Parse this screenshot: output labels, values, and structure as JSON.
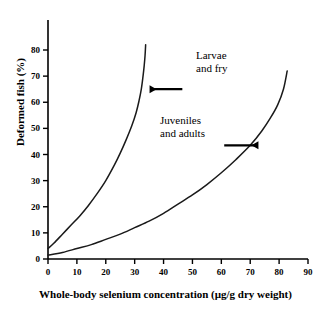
{
  "chart_data": {
    "type": "line",
    "title": "",
    "xlabel": "Whole-body selenium concentration (µg/g dry weight)",
    "ylabel": "Deformed fish (%)",
    "xlim": [
      0,
      90
    ],
    "ylim": [
      0,
      80
    ],
    "xticks": [
      0,
      10,
      20,
      30,
      40,
      50,
      60,
      70,
      80,
      90
    ],
    "yticks": [
      0,
      10,
      20,
      30,
      40,
      50,
      60,
      70,
      80
    ],
    "grid": false,
    "legend": "none",
    "line_color": "#1a1a1a",
    "axis_color": "#000000",
    "series": [
      {
        "name": "Larvae and fry",
        "x": [
          0,
          2,
          5,
          8,
          11,
          14,
          17,
          20,
          23,
          25,
          27,
          29,
          30.5,
          31.5,
          32.3,
          32.9,
          33.3,
          33.6,
          33.8
        ],
        "y": [
          4,
          6,
          9.5,
          13,
          16.5,
          20.5,
          25,
          30,
          36,
          40.5,
          45.5,
          51,
          56,
          60.5,
          65,
          70,
          74,
          78,
          82
        ]
      },
      {
        "name": "Juveniles and adults",
        "x": [
          0,
          5,
          10,
          15,
          20,
          25,
          30,
          35,
          40,
          45,
          50,
          55,
          60,
          65,
          70,
          74,
          77,
          79.5,
          81.5,
          82.8
        ],
        "y": [
          1.5,
          2.5,
          4,
          5.5,
          7.5,
          9.5,
          12,
          14.5,
          17.5,
          21,
          24.5,
          28.5,
          33,
          38,
          43.5,
          49,
          54,
          59,
          65,
          72
        ]
      }
    ],
    "annotations": [
      {
        "name": "larvae-and-fry",
        "text": "Larvae\nand fry",
        "arrow_direction": "left",
        "arrow_from_x": 46.5,
        "arrow_from_y": 65,
        "arrow_to_x": 35.5,
        "arrow_to_y": 65
      },
      {
        "name": "juveniles-and-adults",
        "text": "Juveniles\nand adults",
        "arrow_direction": "right",
        "arrow_from_x": 61,
        "arrow_from_y": 43.5,
        "arrow_to_x": 72.5,
        "arrow_to_y": 43.5
      }
    ]
  }
}
